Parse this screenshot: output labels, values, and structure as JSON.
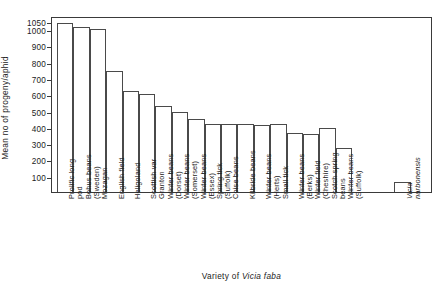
{
  "chart_data": {
    "type": "bar",
    "title": "",
    "xlabel": "Variety of Vicia faba",
    "xlabel_plain": "Variety of ",
    "xlabel_species": "Vicia faba",
    "ylabel": "Mean no of progeny/aphid",
    "ylim": [
      0,
      1080
    ],
    "ytick_values": [
      100,
      200,
      300,
      400,
      500,
      600,
      700,
      800,
      900,
      1000,
      1050
    ],
    "ytick_labels": [
      "100",
      "200",
      "300",
      "400",
      "500",
      "600",
      "700",
      "800",
      "900",
      "1000",
      "1050"
    ],
    "grid": false,
    "legend": null,
    "categories": [
      "Prolific long pod",
      "Bohus beans (Sweden)",
      "Mozagan",
      "English field",
      "Heligoland",
      "Scottish var Granton",
      "Winter beans (Dorset)",
      "Winter beans (Somerset)",
      "Winter beans (Essex)",
      "Spring tick (Suffolk)",
      "Coise beans",
      "Kilbride beans",
      "Winter beans (Herts)",
      "Small tick",
      "Winter beans (Berks)",
      "Winter field (Cheshire)",
      "Scotch spring beans",
      "Winter beans (Suffolk)",
      "Vicia narbonensis"
    ],
    "category_lines": [
      [
        "Prolific long",
        "pod"
      ],
      [
        "Bohus beans",
        "(Sweden)"
      ],
      [
        "Mozagan"
      ],
      [
        "English field"
      ],
      [
        "Heligoland"
      ],
      [
        "Scottish var",
        "Granton"
      ],
      [
        "Winter beans",
        "(Dorset)"
      ],
      [
        "Winter beans",
        "(Somerset)"
      ],
      [
        "Winter beans",
        "(Essex)"
      ],
      [
        "Spring tick",
        "(Suffolk)"
      ],
      [
        "Coise beans"
      ],
      [
        "Kilbride beans"
      ],
      [
        "Winter beans",
        "(Herts)"
      ],
      [
        "Small tick"
      ],
      [
        "Winter beans",
        "(Berks)"
      ],
      [
        "Winter field",
        "(Cheshire)"
      ],
      [
        "Scotch spring",
        "beans"
      ],
      [
        "Winter beans",
        "(Suffolk)"
      ],
      [
        "Vicia",
        "narbonensis"
      ]
    ],
    "values": [
      1040,
      1010,
      1000,
      745,
      620,
      600,
      530,
      490,
      450,
      420,
      415,
      420,
      410,
      415,
      360,
      355,
      390,
      270,
      60
    ],
    "separated_last_bar": true
  }
}
